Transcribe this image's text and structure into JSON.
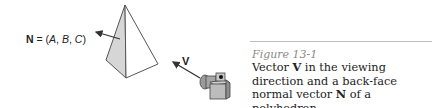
{
  "figure": {
    "normal_label": {
      "symbol": "N",
      "equals": " = (",
      "A": "A",
      "sep1": ", ",
      "B": "B",
      "sep2": ", ",
      "C": "C",
      "close": ")"
    },
    "view_label": "V",
    "icons": [
      "pyramid-icon",
      "camera-icon",
      "arrow-icon"
    ]
  },
  "caption": {
    "figure_number": "Figure 13-1",
    "text_part1": "Vector ",
    "bold1": "V",
    "text_part2": " in the viewing direction and a back-face normal vector ",
    "bold2": "N",
    "text_part3": " of a polyhedron."
  },
  "colors": {
    "shaded_face": "#d6d6d6",
    "line": "#444444",
    "caption_label": "#8a8a8a"
  }
}
